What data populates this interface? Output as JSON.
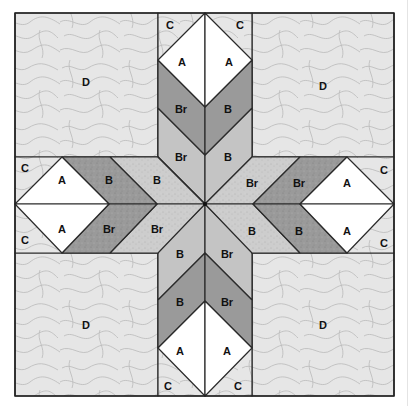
{
  "diagram": {
    "colors": {
      "outline": "#2a2a2a",
      "background_fabric_D": "#e6e6e6",
      "corner_fabric_C": "#e2e2e2",
      "patch_A": "#ffffff",
      "dark_band": "#9a9a9a",
      "light_band_vertical": "#c4c4c4",
      "light_band_horizontal": "#cdcdcd",
      "swirl": "#b9b9b9"
    },
    "labels": {
      "D_top_left": "D",
      "D_top_right": "D",
      "D_bottom_left": "D",
      "D_bottom_right": "D",
      "top": {
        "C_left": "C",
        "C_right": "C",
        "A_left": "A",
        "A_right": "A",
        "dark_left": "Br",
        "dark_right": "B",
        "light_left": "Br",
        "light_right": "B"
      },
      "bottom": {
        "C_left": "C",
        "C_right": "C",
        "A_left": "A",
        "A_right": "A",
        "dark_left": "B",
        "dark_right": "Br",
        "light_left": "B",
        "light_right": "Br"
      },
      "left": {
        "C_top": "C",
        "C_bottom": "C",
        "A_top": "A",
        "A_bottom": "A",
        "dark_top": "B",
        "dark_bottom": "Br",
        "light_top": "B",
        "light_bottom": "Br"
      },
      "right": {
        "C_top": "C",
        "C_bottom": "C",
        "A_top": "A",
        "A_bottom": "A",
        "dark_top": "Br",
        "dark_bottom": "B",
        "light_top": "Br",
        "light_bottom": "B"
      }
    }
  }
}
